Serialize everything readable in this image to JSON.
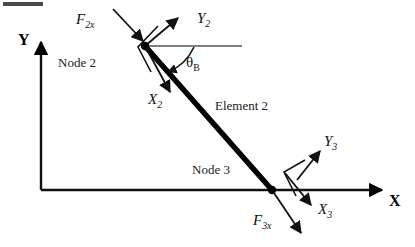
{
  "figure": {
    "corner_mark": "",
    "colors": {
      "line": "#111111",
      "beam": "#000000",
      "thin_line": "#555555",
      "text": "#111111"
    }
  },
  "global_axes": {
    "y_label": "Y",
    "x_label": "X",
    "origin": {
      "x": 41,
      "y": 190
    },
    "y_tip": {
      "x": 41,
      "y": 40
    },
    "x_tip": {
      "x": 385,
      "y": 190
    }
  },
  "nodes": [
    {
      "id": "node-2",
      "label": "Node 2",
      "point": {
        "x": 145,
        "y": 46
      }
    },
    {
      "id": "node-3",
      "label": "Node 3",
      "point": {
        "x": 272,
        "y": 190
      }
    }
  ],
  "element": {
    "label": "Element 2",
    "from": "node-2",
    "to": "node-3"
  },
  "angle": {
    "symbol": "θ",
    "subscript": "B",
    "measured_from": "horizontal reference line at Node 2"
  },
  "local_axes": [
    {
      "id": "local-axes-2",
      "x_label": "X",
      "x_sub": "2",
      "y_label": "Y",
      "y_sub": "2",
      "at_node": "node-2"
    },
    {
      "id": "local-axes-3",
      "x_label": "X",
      "x_sub": "3",
      "y_label": "Y",
      "y_sub": "3",
      "at_node": "node-3"
    }
  ],
  "forces": [
    {
      "id": "force-f2x",
      "symbol": "F",
      "subscript": "2x",
      "at_node": "node-2"
    },
    {
      "id": "force-f3x",
      "symbol": "F",
      "subscript": "3x",
      "at_node": "node-3"
    }
  ]
}
